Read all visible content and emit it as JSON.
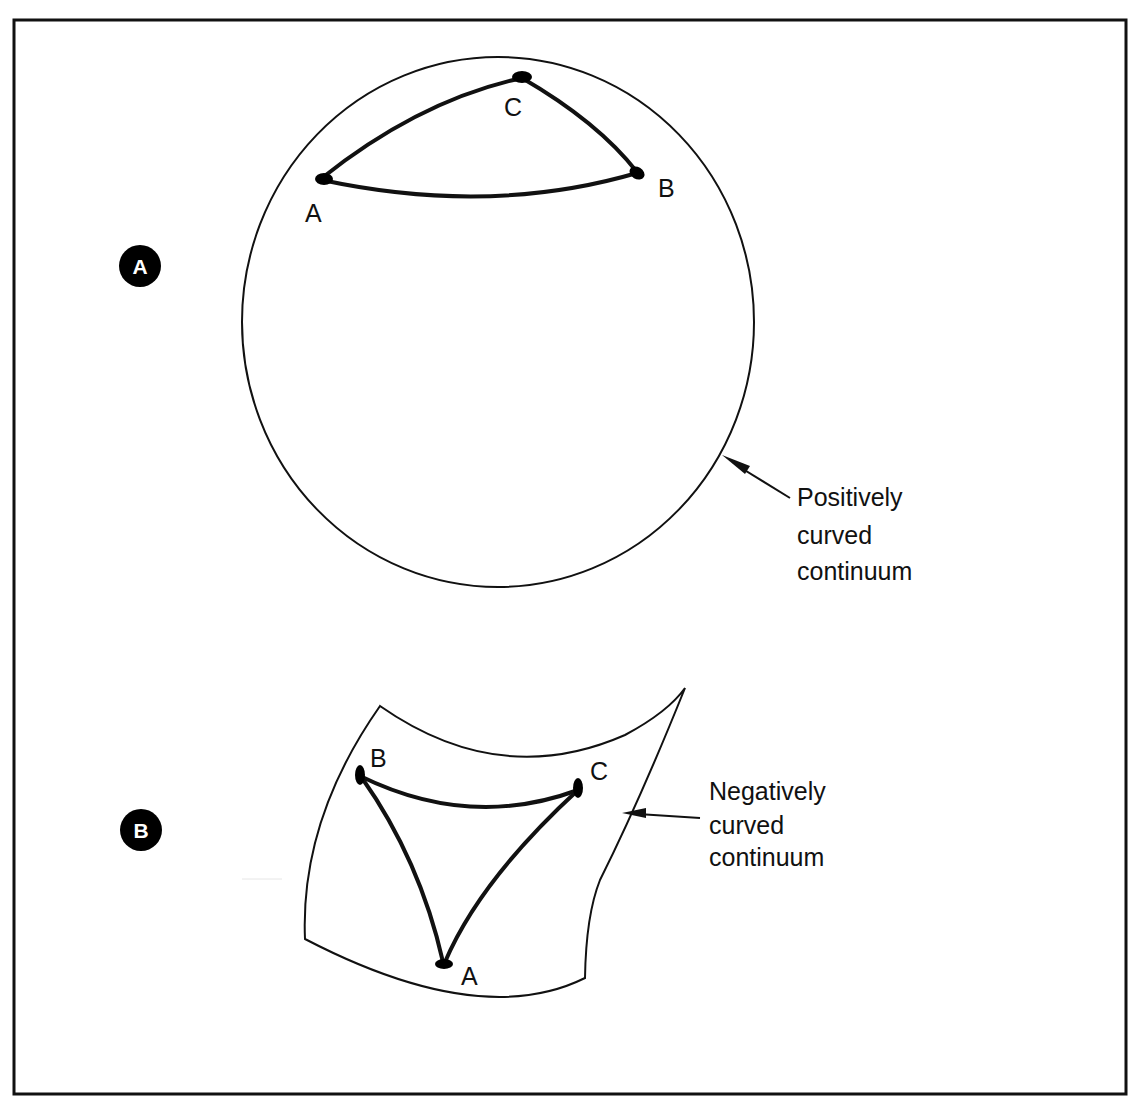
{
  "figure": {
    "colors": {
      "ink": "#111111",
      "background": "#ffffff",
      "badge_fill": "#000000",
      "badge_text": "#ffffff"
    },
    "panels": [
      {
        "id": "A",
        "badge": "A",
        "surface": "sphere",
        "caption_lines": [
          "Positively",
          "curved",
          "continuum"
        ],
        "vertices": [
          {
            "name": "A",
            "label": "A"
          },
          {
            "name": "B",
            "label": "B"
          },
          {
            "name": "C",
            "label": "C"
          }
        ]
      },
      {
        "id": "B",
        "badge": "B",
        "surface": "saddle",
        "caption_lines": [
          "Negatively",
          "curved",
          "continuum"
        ],
        "vertices": [
          {
            "name": "A",
            "label": "A"
          },
          {
            "name": "B",
            "label": "B"
          },
          {
            "name": "C",
            "label": "C"
          }
        ]
      }
    ]
  }
}
